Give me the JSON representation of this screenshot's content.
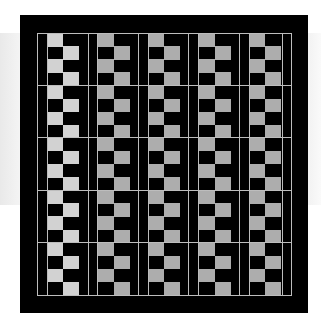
{
  "pattern": {
    "description": "Black frame with checkerboard columns",
    "colors": {
      "background": "#ffffff",
      "frame": "#000000",
      "light_cell_first_column": "#d2d2d2",
      "light_cell_other_columns": "#adadad",
      "grid_line": "#bdbdbd"
    },
    "columns": 5,
    "major_rows": 5,
    "cells_per_column_block": 2,
    "cell_rows_per_major_row": 4
  }
}
